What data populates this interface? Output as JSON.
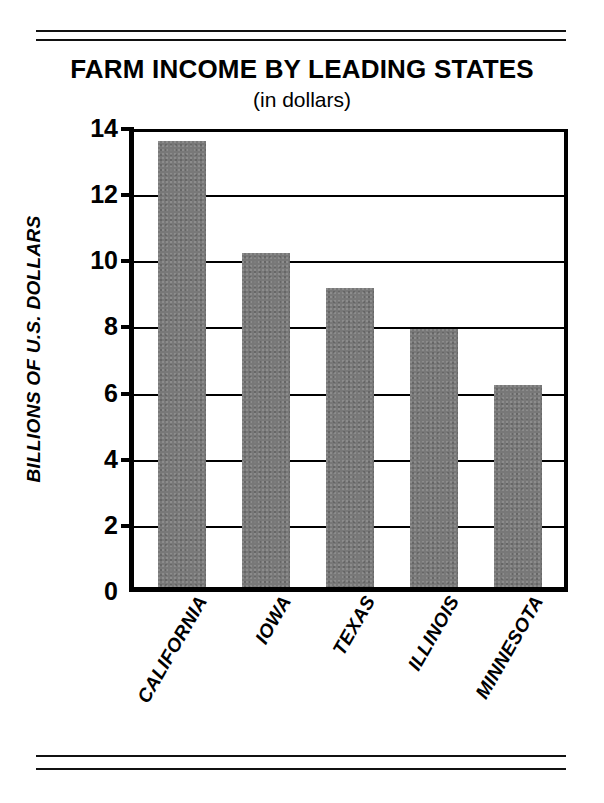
{
  "chart_data": {
    "type": "bar",
    "title": "FARM INCOME BY LEADING STATES",
    "subtitle": "(in dollars)",
    "xlabel": "",
    "ylabel": "BILLIONS OF U.S. DOLLARS",
    "categories": [
      "CALIFORNIA",
      "IOWA",
      "TEXAS",
      "ILLINOIS",
      "MINNESOTA"
    ],
    "values": [
      13.5,
      10.1,
      9.05,
      7.8,
      6.1
    ],
    "ylim": [
      0,
      14
    ],
    "yticks": [
      0,
      2,
      4,
      6,
      8,
      10,
      12,
      14
    ],
    "ytick_labels": [
      "0",
      "2",
      "4",
      "6",
      "8",
      "10",
      "12",
      "14"
    ],
    "grid": true,
    "legend": null,
    "bar_color": "#787878",
    "axis_color": "#000000",
    "background_color": "#ffffff"
  },
  "decoration": {
    "top_rule_label": "double-rule-top",
    "bottom_rule_label": "double-rule-bottom"
  }
}
